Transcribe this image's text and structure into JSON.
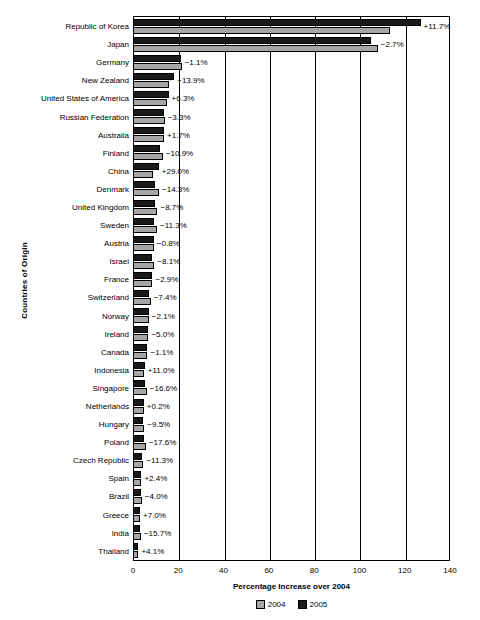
{
  "chart_data": {
    "type": "bar",
    "orientation": "horizontal",
    "title": "",
    "xlabel": "Percentage Increase over 2004",
    "ylabel": "Countries of Origin",
    "xlim": [
      0,
      140
    ],
    "xticks": [
      0,
      20,
      40,
      60,
      80,
      100,
      120,
      140
    ],
    "grid": true,
    "legend_position": "bottom",
    "categories": [
      "Republic of Korea",
      "Japan",
      "Germany",
      "New Zealand",
      "United States of America",
      "Russian Federation",
      "Australia",
      "Finland",
      "China",
      "Denmark",
      "United Kingdom",
      "Sweden",
      "Austria",
      "Israel",
      "France",
      "Switzerland",
      "Norway",
      "Ireland",
      "Canada",
      "Indonesia",
      "Singapore",
      "Netherlands",
      "Hungary",
      "Poland",
      "Czech Republic",
      "Spain",
      "Brazil",
      "Greece",
      "India",
      "Thailand"
    ],
    "series": [
      {
        "name": "2004",
        "color": "#a6a6a6",
        "values": [
          113.7,
          108.1,
          21.5,
          16.0,
          14.8,
          14.0,
          13.5,
          13.2,
          8.8,
          11.5,
          10.8,
          10.6,
          9.2,
          9.4,
          8.6,
          7.8,
          7.0,
          6.8,
          6.4,
          4.7,
          6.1,
          4.8,
          5.0,
          5.7,
          4.6,
          3.6,
          3.9,
          2.9,
          3.5,
          2.3
        ]
      },
      {
        "name": "2005",
        "color": "#1a1a1a",
        "values": [
          127.0,
          105.2,
          21.3,
          18.2,
          15.7,
          13.5,
          13.7,
          11.8,
          11.4,
          9.9,
          9.9,
          9.4,
          9.1,
          8.6,
          8.4,
          7.2,
          6.9,
          6.5,
          6.3,
          5.2,
          5.1,
          4.8,
          4.5,
          4.7,
          4.1,
          3.7,
          3.7,
          3.1,
          3.0,
          2.4
        ]
      }
    ],
    "data_labels": [
      "+11.7%",
      "-2.7%",
      "-1.1%",
      "+13.9%",
      "+6.3%",
      "-3.3%",
      "+1.7%",
      "-10.9%",
      "+29.0%",
      "-14.3%",
      "-8.7%",
      "-11.3%",
      "-0.8%",
      "-8.1%",
      "-2.9%",
      "-7.4%",
      "-2.1%",
      "-5.0%",
      "-1.1%",
      "+11.0%",
      "-16.6%",
      "+0.2%",
      "-9.5%",
      "-17.6%",
      "-11.3%",
      "+2.4%",
      "-4.0%",
      "+7.0%",
      "-15.7%",
      "+4.1%"
    ],
    "legend": [
      "2004",
      "2005"
    ]
  }
}
